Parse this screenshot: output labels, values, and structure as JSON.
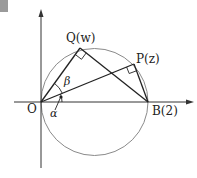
{
  "diagram": {
    "type": "complex-plane-geometry",
    "colors": {
      "axis": "#333333",
      "circle": "#8a8a8a",
      "segment": "#222222",
      "corner_mark": "#9a9a9a"
    },
    "points": {
      "O": {
        "label": "O",
        "x": 41,
        "y": 102
      },
      "B": {
        "label": "B(2)",
        "x": 148,
        "y": 102
      },
      "Q": {
        "label": "Q(w)",
        "x": 80,
        "y": 48
      },
      "P": {
        "label": "P(z)",
        "x": 134,
        "y": 64
      }
    },
    "angles": {
      "alpha": "α",
      "beta": "β"
    },
    "circle": {
      "cx": 94.5,
      "cy": 102,
      "r": 53.5
    },
    "labels": {
      "O": "O",
      "B": "B(2)",
      "Q": "Q(w)",
      "P": "P(z)",
      "alpha": "α",
      "beta": "β"
    }
  }
}
